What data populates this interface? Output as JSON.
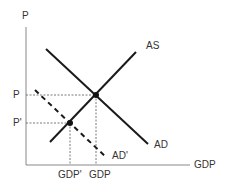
{
  "diagram": {
    "axes": {
      "y_label": "P",
      "x_label": "GDP"
    },
    "curves": {
      "as_label": "AS",
      "ad_label": "AD",
      "ad_shifted_label": "AD'"
    },
    "levels": {
      "price_original": "P",
      "price_new": "P'",
      "gdp_original": "GDP",
      "gdp_new": "GDP'"
    },
    "colors": {
      "line": "#1a1a1a",
      "axis": "#888888",
      "guide": "#555555",
      "text": "#333333"
    }
  }
}
